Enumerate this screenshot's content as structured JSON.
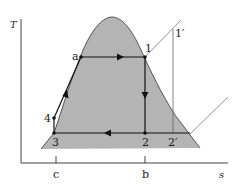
{
  "diagram": {
    "type": "T-s diagram (vapor power cycle)",
    "axes": {
      "y_label": "T",
      "x_label": "s"
    },
    "states": [
      {
        "id": "a",
        "label": "a"
      },
      {
        "id": "1",
        "label": "1"
      },
      {
        "id": "1p",
        "label": "1′"
      },
      {
        "id": "2",
        "label": "2"
      },
      {
        "id": "2p",
        "label": "2′"
      },
      {
        "id": "3",
        "label": "3"
      },
      {
        "id": "4",
        "label": "4"
      }
    ],
    "ticks": [
      {
        "id": "c",
        "label": "c"
      },
      {
        "id": "b",
        "label": "b"
      }
    ],
    "colors": {
      "dome_fill": "#b4b4b4",
      "dome_stroke": "#555555",
      "process_line": "#111111",
      "thin_line": "#666666",
      "axis": "#444444"
    }
  }
}
